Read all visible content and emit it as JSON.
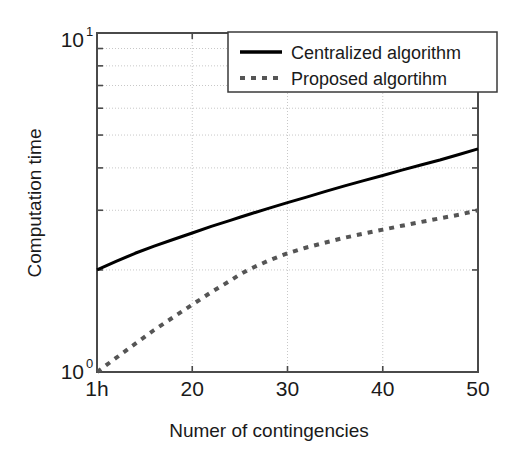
{
  "chart_data": {
    "type": "line",
    "title": "",
    "xlabel": "Numer of contingencies",
    "ylabel": "Computation time",
    "xscale": "linear",
    "yscale": "log",
    "xlim": [
      10,
      50
    ],
    "ylim": [
      1,
      10
    ],
    "grid": true,
    "grid_style": "dotted",
    "legend_position": "top-right",
    "x_ticks": [
      {
        "value": 10,
        "label": "1h"
      },
      {
        "value": 20,
        "label": "20"
      },
      {
        "value": 30,
        "label": "30"
      },
      {
        "value": 40,
        "label": "40"
      },
      {
        "value": 50,
        "label": "50"
      }
    ],
    "y_ticks": [
      {
        "value": 1,
        "mantissa": "10",
        "exponent": "0"
      },
      {
        "value": 10,
        "mantissa": "10",
        "exponent": "1"
      }
    ],
    "y_minor_ticks": [
      2,
      3,
      4,
      5,
      6,
      7,
      8,
      9
    ],
    "x": [
      10,
      12,
      14,
      16,
      18,
      20,
      22,
      24,
      25,
      26,
      28,
      30,
      32,
      34,
      36,
      38,
      40,
      42,
      44,
      46,
      48,
      50
    ],
    "series": [
      {
        "name": "Centralized algorithm",
        "style": "solid",
        "color": "#000000",
        "width": 3,
        "values": [
          2.0,
          2.12,
          2.24,
          2.35,
          2.46,
          2.57,
          2.69,
          2.8,
          2.86,
          2.92,
          3.04,
          3.16,
          3.28,
          3.41,
          3.54,
          3.67,
          3.8,
          3.94,
          4.08,
          4.22,
          4.38,
          4.55
        ]
      },
      {
        "name": "Proposed algortihm",
        "style": "dotted",
        "color": "#555555",
        "width": 4,
        "values": [
          1.0,
          1.1,
          1.21,
          1.33,
          1.45,
          1.58,
          1.72,
          1.86,
          1.94,
          2.01,
          2.13,
          2.24,
          2.33,
          2.41,
          2.49,
          2.56,
          2.63,
          2.7,
          2.77,
          2.84,
          2.91,
          3.0
        ]
      }
    ]
  },
  "legend": {
    "entries": [
      {
        "label": "Centralized algorithm",
        "marker": "solid-line"
      },
      {
        "label": "Proposed algortihm",
        "marker": "dotted-line"
      }
    ]
  },
  "colors": {
    "axis": "#4a4a4a",
    "grid": "#c8c8c8",
    "text": "#1a1a1a",
    "series_primary": "#000000",
    "series_secondary": "#555555",
    "background": "#ffffff"
  }
}
